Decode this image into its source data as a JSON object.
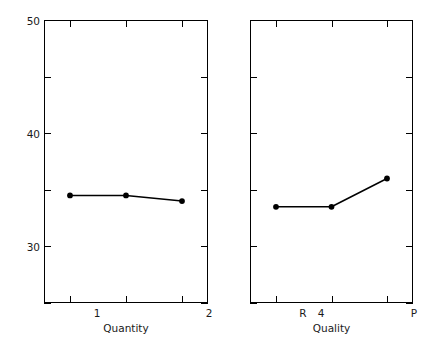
{
  "figure": {
    "background_color": "#ffffff",
    "axis_color": "#000000",
    "series_color": "#000000",
    "shared_ylabel": "Per cent taken by subordinate"
  },
  "chart_data": [
    {
      "type": "line",
      "panel": "left",
      "title": "",
      "xlabel": "Quantity",
      "ylabel": "Per cent taken by subordinate",
      "categories": [
        "1",
        "2",
        "4"
      ],
      "values": [
        19,
        19,
        18
      ],
      "ylim": [
        0,
        50
      ],
      "yticks": [
        0,
        10,
        20,
        30,
        40,
        50
      ],
      "ytick_labels": [
        "0",
        "10",
        "20",
        "30",
        "40",
        "50"
      ],
      "grid": false,
      "legend": "none",
      "marker": "filled-circle",
      "line_style": "solid"
    },
    {
      "type": "line",
      "panel": "right",
      "title": "",
      "xlabel": "Quality",
      "ylabel": "",
      "categories": [
        "R",
        "P",
        "M"
      ],
      "values": [
        17,
        17,
        22
      ],
      "ylim": [
        0,
        50
      ],
      "yticks": [
        0,
        10,
        20,
        30,
        40,
        50
      ],
      "ytick_labels": [
        "",
        "",
        "",
        "",
        "",
        ""
      ],
      "grid": false,
      "legend": "none",
      "marker": "filled-circle",
      "line_style": "solid"
    }
  ]
}
